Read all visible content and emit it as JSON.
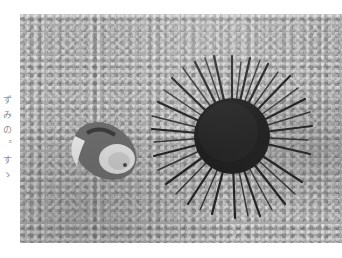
{
  "photo": {
    "subject": "Sea urchin and shell on sandy seabed",
    "palette": {
      "sand": "#a9a9a9",
      "urchin_body": "#1a1a1a",
      "urchin_spines": "#2b2b2b",
      "shell_light": "#e8e8e8",
      "shell_dark": "#4a4a4a"
    }
  },
  "margin_caption": {
    "text": "ずみの。すゝ",
    "legibility": "uncertain, approximate reading only"
  }
}
